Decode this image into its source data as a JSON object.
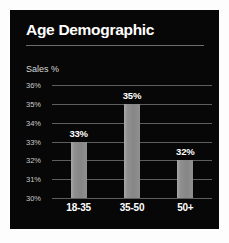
{
  "card": {
    "background_color": "#070707",
    "title": "Age Demographic",
    "divider_color": "#6d6d6d"
  },
  "chart_data": {
    "type": "bar",
    "title": "Age Demographic",
    "subtitle": "",
    "xlabel": "",
    "ylabel": "Sales %",
    "categories": [
      "18-35",
      "35-50",
      "50+"
    ],
    "values": [
      33,
      35,
      32
    ],
    "value_labels": [
      "33%",
      "35%",
      "32%"
    ],
    "ylim": [
      30,
      36
    ],
    "yticks": [
      30,
      31,
      32,
      33,
      34,
      35,
      36
    ],
    "ytick_labels": [
      "30%",
      "31%",
      "32%",
      "33%",
      "34%",
      "35%",
      "36%"
    ],
    "grid": true,
    "grid_color": "#5e5e5e",
    "legend": false,
    "legend_position": "none",
    "bar_color": "#8f8f8f",
    "text_color": "#ffffff",
    "tick_color": "#c9c9c9"
  }
}
